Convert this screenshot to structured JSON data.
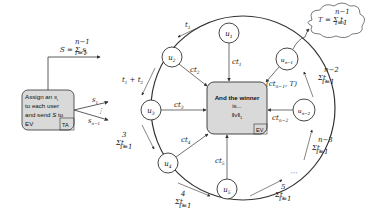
{
  "diagram": {
    "ta_box": {
      "lines": [
        "Assign an s_i",
        "to each user",
        "and send S to",
        "EV"
      ],
      "tag": "TA"
    },
    "ev_box": {
      "lines": [
        "And the winner",
        "is...",
        "||v||_1"
      ],
      "tag": "EV"
    },
    "top_formula": "S = Σ_{i=1}^{n-1} s_i",
    "cloud_formula": "T = Σ_{i=1}^{n-1} t_i",
    "nodes": [
      {
        "id": "u1",
        "label": "u_1"
      },
      {
        "id": "u2",
        "label": "u_2"
      },
      {
        "id": "u3",
        "label": "u_3"
      },
      {
        "id": "u4",
        "label": "u_4"
      },
      {
        "id": "u5",
        "label": "u_5"
      },
      {
        "id": "un2",
        "label": "u_{n-2}"
      },
      {
        "id": "un1",
        "label": "u_{n-1}"
      }
    ],
    "edge_labels": {
      "ct1": "ct_1",
      "ct2": "ct_2",
      "ct3": "ct_3",
      "ct4": "ct_4",
      "ct5": "ct_5",
      "ctn2": "ct_{n-2}",
      "ctn1": "(ct_{n-1}, T)",
      "s1": "s_1",
      "sn1": "s_{n-1}",
      "t1": "t_1",
      "t1t2": "t_1 + t_2",
      "sum3": "Σ_{i=1}^{3} t_i",
      "sum4": "Σ_{i=1}^{4} t_i",
      "sum5": "Σ_{i=1}^{5} t_i",
      "sumn3": "Σ_{i=1}^{n-3} t_i",
      "sumn2": "Σ_{i=1}^{n-2} t_i"
    }
  }
}
